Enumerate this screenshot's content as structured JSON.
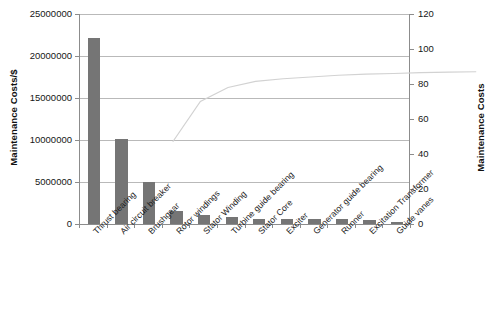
{
  "chart_data": {
    "type": "bar",
    "title": "",
    "subtitle": "",
    "xlabel": "",
    "ylabel": "Maintenance Costs/$",
    "y2label": "Maintenance Costs",
    "grid": true,
    "legend": "none",
    "categories": [
      "Thrust bearing",
      "Air circuit breaker",
      "Brushgear",
      "Rotor windings",
      "Stator Winding",
      "Turbine guide bearing",
      "Stator Core",
      "Exciter",
      "Generator guide bearing",
      "Runner",
      "Excitation Transformer",
      "Guide vanes"
    ],
    "series": [
      {
        "name": "Maintenance Costs/$",
        "axis": "left",
        "type": "bar",
        "color": "#757575",
        "values": [
          22150000,
          10100000,
          5000000,
          1550000,
          1070000,
          830000,
          640000,
          600000,
          620000,
          600000,
          480000,
          210000
        ]
      },
      {
        "name": "Cumulative Maintenance Costs",
        "axis": "right",
        "type": "line",
        "color": "#d2d2d2",
        "values": [
          55,
          78,
          86,
          89.5,
          91,
          92,
          93,
          93.6,
          94,
          94.5,
          94.8,
          95
        ]
      }
    ],
    "ylim": [
      0,
      25000000
    ],
    "ytick_labels": [
      "0",
      "5000000",
      "10000000",
      "15000000",
      "20000000",
      "25000000"
    ],
    "ytick_values": [
      0,
      5000000,
      10000000,
      15000000,
      20000000,
      25000000
    ],
    "y2lim": [
      0,
      120
    ],
    "y2tick_labels": [
      "0",
      "20",
      "40",
      "60",
      "80",
      "100",
      "120"
    ],
    "y2tick_values": [
      0,
      20,
      40,
      60,
      80,
      100,
      120
    ]
  }
}
